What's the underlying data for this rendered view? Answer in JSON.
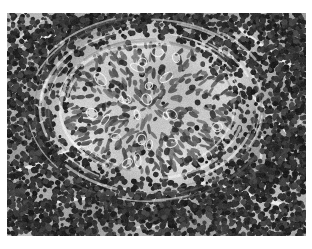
{
  "page": {
    "background_color": "#ffffff",
    "width": 312,
    "height": 249
  },
  "figure": {
    "name": "histopathology-micrograph",
    "alt_text": "Grayscale histopathology micrograph of lymphoid tissue containing a central pale epithelioid granuloma surrounded by densely packed small dark lymphocyte nuclei",
    "stain": "Hematoxylin and eosin",
    "color_mode": "grayscale",
    "caption": "",
    "frame": {
      "left": 7,
      "top": 13,
      "width": 299,
      "height": 223
    },
    "palette": {
      "page_white": "#ffffff",
      "background_tissue": "#c2c2c2",
      "pale_granuloma": "#cfcfcf",
      "mid_gray": "#9a9a9a",
      "nucleus_dark": "#3a3a3a",
      "nucleus_darkest": "#1f1f1f",
      "sinusoid_white": "#f2f2f2"
    }
  },
  "chart_data": {
    "type": "heatmap",
    "xlabel": "",
    "ylabel": "",
    "grid": false,
    "legend_position": "none",
    "regions": [
      {
        "label": "central epithelioid granuloma",
        "center_x": 150,
        "center_y": 108,
        "radius_x": 85,
        "radius_y": 63,
        "mean_gray": 205,
        "nucleus_density": "low",
        "nucleus_shape": "elongated oval epithelioid"
      },
      {
        "label": "concentric cuff of compressed cells",
        "center_x": 150,
        "center_y": 108,
        "radius_x": 112,
        "radius_y": 85,
        "mean_gray": 168,
        "nucleus_density": "medium",
        "nucleus_shape": "spindled / swirled"
      },
      {
        "label": "peripheral dense lymphocytes",
        "center_x": 150,
        "center_y": 110,
        "radius_x": 160,
        "radius_y": 125,
        "mean_gray": 132,
        "nucleus_density": "high",
        "nucleus_shape": "small round dark"
      }
    ],
    "sinusoid_streaks": [
      {
        "x1": 16,
        "y1": 172,
        "x2": 96,
        "y2": 140,
        "width": 4
      },
      {
        "x1": 198,
        "y1": 182,
        "x2": 286,
        "y2": 206,
        "width": 4
      },
      {
        "x1": 232,
        "y1": 22,
        "x2": 292,
        "y2": 66,
        "width": 3
      },
      {
        "x1": 22,
        "y1": 40,
        "x2": 86,
        "y2": 30,
        "width": 3
      },
      {
        "x1": 252,
        "y1": 96,
        "x2": 300,
        "y2": 150,
        "width": 3
      },
      {
        "x1": 36,
        "y1": 206,
        "x2": 120,
        "y2": 196,
        "width": 3
      }
    ]
  }
}
